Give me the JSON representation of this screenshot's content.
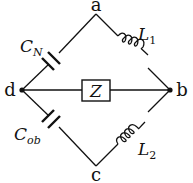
{
  "diagram": {
    "type": "circuit-bridge",
    "nodes": {
      "a": {
        "label": "a"
      },
      "b": {
        "label": "b"
      },
      "c": {
        "label": "c"
      },
      "d": {
        "label": "d"
      }
    },
    "components": [
      {
        "id": "CN",
        "kind": "capacitor",
        "symbol": "C",
        "subscript": "N",
        "between": [
          "d",
          "a"
        ]
      },
      {
        "id": "L1",
        "kind": "inductor",
        "symbol": "L",
        "subscript": "1",
        "between": [
          "a",
          "b"
        ]
      },
      {
        "id": "Cob",
        "kind": "capacitor",
        "symbol": "C",
        "subscript": "ob",
        "between": [
          "d",
          "c"
        ]
      },
      {
        "id": "L2",
        "kind": "inductor",
        "symbol": "L",
        "subscript": "2",
        "between": [
          "c",
          "b"
        ]
      },
      {
        "id": "Z",
        "kind": "impedance",
        "symbol": "Z",
        "subscript": "",
        "between": [
          "d",
          "b"
        ]
      }
    ]
  }
}
